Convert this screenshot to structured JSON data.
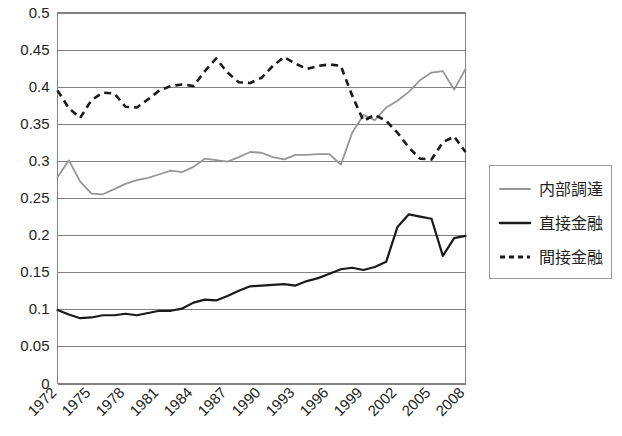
{
  "chart_data": {
    "type": "line",
    "title": "",
    "xlabel": "",
    "ylabel": "",
    "ylim": [
      0,
      0.5
    ],
    "y_ticks": [
      "0",
      "0.05",
      "0.1",
      "0.15",
      "0.2",
      "0.25",
      "0.3",
      "0.35",
      "0.4",
      "0.45",
      "0.5"
    ],
    "y_tick_values": [
      0,
      0.05,
      0.1,
      0.15,
      0.2,
      0.25,
      0.3,
      0.35,
      0.4,
      0.45,
      0.5
    ],
    "grid": true,
    "legend_position": "right",
    "x": [
      1972,
      1973,
      1974,
      1975,
      1976,
      1977,
      1978,
      1979,
      1980,
      1981,
      1982,
      1983,
      1984,
      1985,
      1986,
      1987,
      1988,
      1989,
      1990,
      1991,
      1992,
      1993,
      1994,
      1995,
      1996,
      1997,
      1998,
      1999,
      2000,
      2001,
      2002,
      2003,
      2004,
      2005,
      2006,
      2007,
      2008
    ],
    "x_tick_labels": [
      "1972",
      "1975",
      "1978",
      "1981",
      "1984",
      "1987",
      "1990",
      "1993",
      "1996",
      "1999",
      "2002",
      "2005",
      "2008"
    ],
    "x_tick_values": [
      1972,
      1975,
      1978,
      1981,
      1984,
      1987,
      1990,
      1993,
      1996,
      1999,
      2002,
      2005,
      2008
    ],
    "series": [
      {
        "name": "内部調達",
        "color": "#969696",
        "style": "solid",
        "values": [
          0.278,
          0.301,
          0.272,
          0.256,
          0.255,
          0.262,
          0.269,
          0.274,
          0.277,
          0.282,
          0.287,
          0.285,
          0.292,
          0.303,
          0.301,
          0.299,
          0.305,
          0.312,
          0.311,
          0.305,
          0.302,
          0.308,
          0.308,
          0.309,
          0.309,
          0.295,
          0.338,
          0.362,
          0.355,
          0.372,
          0.381,
          0.393,
          0.409,
          0.419,
          0.421,
          0.396,
          0.424
        ]
      },
      {
        "name": "直接金融",
        "color": "#1a1a1a",
        "style": "solid",
        "values": [
          0.099,
          0.093,
          0.088,
          0.089,
          0.092,
          0.092,
          0.094,
          0.092,
          0.095,
          0.098,
          0.098,
          0.101,
          0.109,
          0.113,
          0.112,
          0.118,
          0.125,
          0.131,
          0.132,
          0.133,
          0.134,
          0.132,
          0.138,
          0.142,
          0.148,
          0.154,
          0.156,
          0.153,
          0.157,
          0.164,
          0.211,
          0.228,
          0.225,
          0.222,
          0.172,
          0.196,
          0.199
        ]
      },
      {
        "name": "間接金融",
        "color": "#1a1a1a",
        "style": "dashed",
        "values": [
          0.395,
          0.371,
          0.358,
          0.382,
          0.392,
          0.391,
          0.373,
          0.372,
          0.383,
          0.395,
          0.401,
          0.403,
          0.401,
          0.421,
          0.438,
          0.419,
          0.406,
          0.405,
          0.412,
          0.428,
          0.44,
          0.431,
          0.424,
          0.428,
          0.43,
          0.428,
          0.388,
          0.354,
          0.362,
          0.354,
          0.338,
          0.318,
          0.303,
          0.302,
          0.325,
          0.333,
          0.312
        ]
      }
    ]
  },
  "legend": {
    "items": [
      {
        "label": "内部調達",
        "style": "solid-gray"
      },
      {
        "label": "直接金融",
        "style": "solid-black"
      },
      {
        "label": "間接金融",
        "style": "dashed-black"
      }
    ]
  }
}
